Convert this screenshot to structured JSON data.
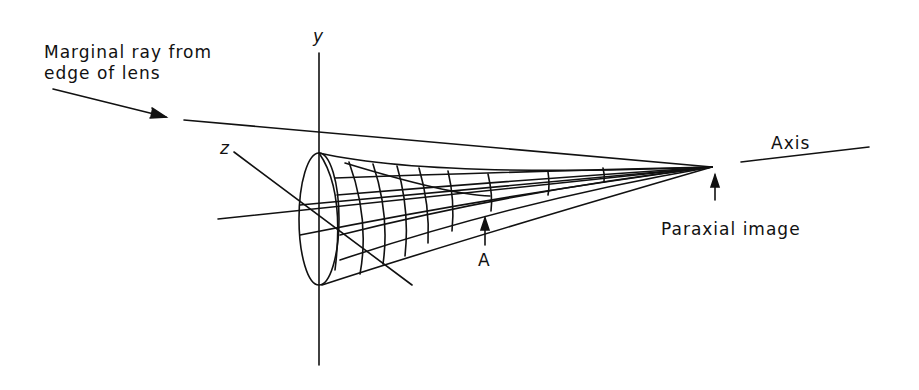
{
  "diagram": {
    "type": "optics-ray-diagram",
    "labels": {
      "marginal_ray_line1": "Marginal ray from",
      "marginal_ray_line2": "edge of lens",
      "y_axis": "y",
      "z_axis": "z",
      "axis": "Axis",
      "point_a": "A",
      "paraxial_image": "Paraxial image"
    },
    "colors": {
      "ink": "#111111",
      "background": "#ffffff"
    }
  }
}
